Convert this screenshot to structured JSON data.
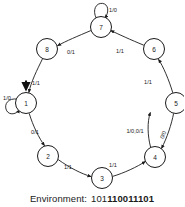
{
  "figure": {
    "type": "finite-state-machine",
    "title": "",
    "caption": {
      "label": "Environment:",
      "sequence_prefix": "101",
      "sequence_bold": "110011101",
      "sequence_full": "101110011101"
    },
    "nodes": [
      {
        "id": "1",
        "label": "1",
        "cx": 26,
        "cy": 103,
        "r": 10.5
      },
      {
        "id": "2",
        "label": "2",
        "cx": 48,
        "cy": 156,
        "r": 10.5
      },
      {
        "id": "3",
        "label": "3",
        "cx": 102,
        "cy": 178,
        "r": 10.5
      },
      {
        "id": "4",
        "label": "4",
        "cx": 155,
        "cy": 157,
        "r": 10.5
      },
      {
        "id": "5",
        "label": "5",
        "cx": 176,
        "cy": 103,
        "r": 10.5
      },
      {
        "id": "6",
        "label": "6",
        "cx": 154,
        "cy": 49,
        "r": 10.5
      },
      {
        "id": "7",
        "label": "7",
        "cx": 101,
        "cy": 27,
        "r": 10.5
      },
      {
        "id": "8",
        "label": "8",
        "cx": 47,
        "cy": 49,
        "r": 10.5
      }
    ],
    "edges": [
      {
        "id": "e8-1",
        "from": "8",
        "to": "1",
        "label": "1/1",
        "label_x": 36,
        "label_y": 83
      },
      {
        "id": "e1-2",
        "from": "1",
        "to": "2",
        "label": "0/1",
        "label_x": 35,
        "label_y": 132
      },
      {
        "id": "e2-3",
        "from": "2",
        "to": "3",
        "label": "1/1",
        "label_x": 68,
        "label_y": 167
      },
      {
        "id": "e3-4",
        "from": "3",
        "to": "4",
        "label": "1/1",
        "label_x": 113,
        "label_y": 165
      },
      {
        "id": "e4-5",
        "from": "4",
        "to": "5",
        "label": "1/0,0/1",
        "label_x": 135,
        "label_y": 131
      },
      {
        "id": "e5-4",
        "from": "5",
        "to": "4",
        "label": "0/0",
        "label_x": 163,
        "label_y": 135
      },
      {
        "id": "e5-6",
        "from": "5",
        "to": "6",
        "label": "1/1",
        "label_x": 148,
        "label_y": 82
      },
      {
        "id": "e6-7",
        "from": "6",
        "to": "7",
        "label": "1/1",
        "label_x": 120,
        "label_y": 51
      },
      {
        "id": "e7-8",
        "from": "7",
        "to": "8",
        "label": "0/1",
        "label_x": 71,
        "label_y": 52
      }
    ],
    "self_loops": [
      {
        "id": "loop-1",
        "node": "1",
        "label": "1/0",
        "label_x": 7,
        "label_y": 98
      },
      {
        "id": "loop-7",
        "node": "7",
        "label": "1/0",
        "label_x": 113,
        "label_y": 10
      }
    ],
    "start_state": "1"
  },
  "colors": {
    "ink": "#1a1a1a",
    "background": "#ffffff"
  }
}
